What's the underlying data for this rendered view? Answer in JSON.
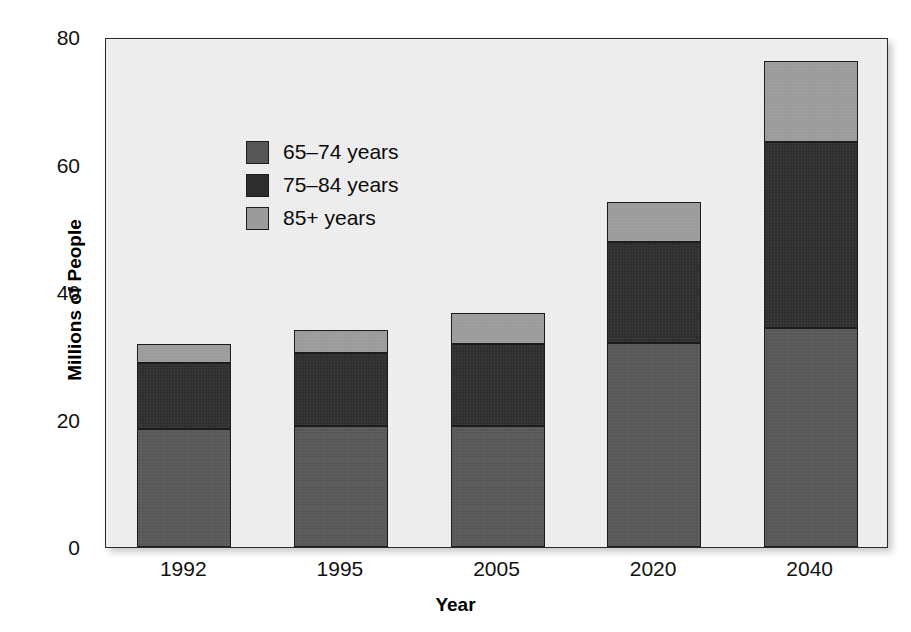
{
  "chart_data": {
    "type": "bar",
    "stacked": true,
    "title": "",
    "xlabel": "Year",
    "ylabel": "Millions of People",
    "categories": [
      "1992",
      "1995",
      "2005",
      "2020",
      "2040"
    ],
    "series": [
      {
        "name": "65–74 years",
        "color": "#575757",
        "values": [
          18.5,
          19.0,
          19.0,
          32.0,
          34.3
        ]
      },
      {
        "name": "75–84 years",
        "color": "#2e2e2e",
        "values": [
          10.3,
          11.4,
          12.9,
          15.8,
          29.2
        ]
      },
      {
        "name": "85+ years",
        "color": "#9b9b9b",
        "values": [
          3.1,
          3.6,
          4.8,
          6.3,
          12.7
        ]
      }
    ],
    "totals": [
      31.9,
      34.0,
      36.7,
      54.1,
      76.2
    ],
    "ylim": [
      0,
      80
    ],
    "yticks": [
      "0",
      "20",
      "40",
      "60",
      "80"
    ],
    "ytick_values": [
      0,
      20,
      40,
      60,
      80
    ],
    "grid": false,
    "legend_position": "upper-left-inside"
  },
  "axes": {
    "y_label": "Millions of People",
    "x_label": "Year",
    "y_ticks": [
      "0",
      "20",
      "40",
      "60",
      "80"
    ],
    "x_ticks": [
      "1992",
      "1995",
      "2005",
      "2020",
      "2040"
    ]
  },
  "legend": {
    "items": [
      {
        "label": "65–74 years",
        "color": "#575757"
      },
      {
        "label": "75–84 years",
        "color": "#2e2e2e"
      },
      {
        "label": "85+ years",
        "color": "#9b9b9b"
      }
    ]
  }
}
